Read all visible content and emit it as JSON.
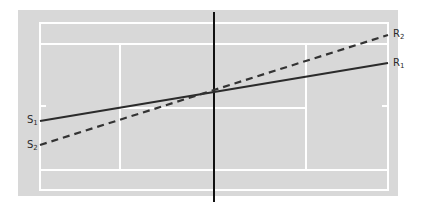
{
  "diagram": {
    "type": "tennis-court-lines",
    "colors": {
      "background": "#d8d8d8",
      "court_lines": "#ffffff",
      "net": "#111111",
      "solid_line": "#2b2b2b",
      "dashed_line": "#333333"
    },
    "lines": [
      {
        "id": "S1-R1",
        "style": "solid",
        "start_label": "S",
        "start_sub": "1",
        "end_label": "R",
        "end_sub": "1"
      },
      {
        "id": "S2-R2",
        "style": "dashed",
        "start_label": "S",
        "start_sub": "2",
        "end_label": "R",
        "end_sub": "2"
      }
    ],
    "labels": {
      "s1": {
        "text": "S",
        "sub": "1"
      },
      "s2": {
        "text": "S",
        "sub": "2"
      },
      "r1": {
        "text": "R",
        "sub": "1"
      },
      "r2": {
        "text": "R",
        "sub": "2"
      }
    }
  }
}
